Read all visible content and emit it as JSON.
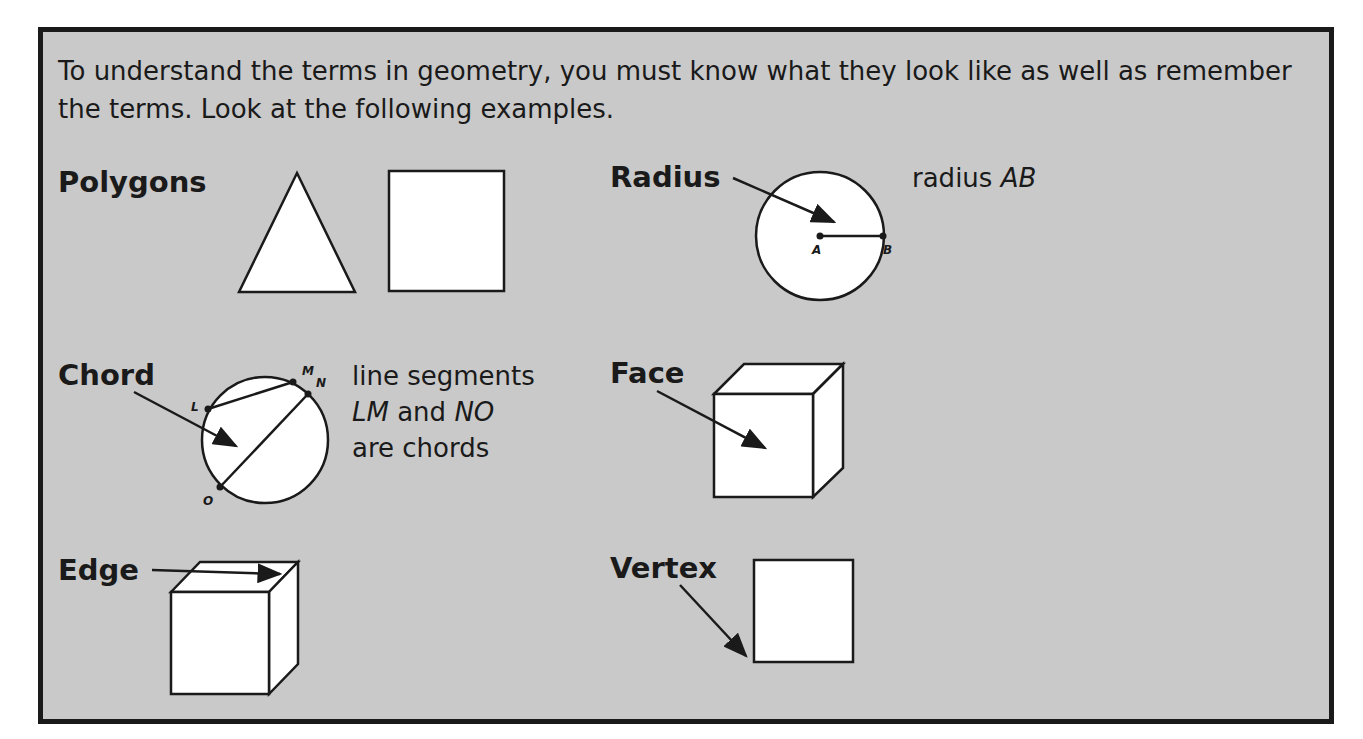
{
  "intro": "To understand the terms in geometry, you must know what they look like as well as remember the terms. Look at the following examples.",
  "terms": {
    "polygons": {
      "label": "Polygons"
    },
    "radius": {
      "label": "Radius",
      "desc_prefix": "radius ",
      "desc_italic": "AB",
      "points": [
        "A",
        "B"
      ]
    },
    "chord": {
      "label": "Chord",
      "desc_line1": "line segments",
      "desc_line2_i1": "LM",
      "desc_line2_mid": " and ",
      "desc_line2_i2": "NO",
      "desc_line3": "are chords",
      "points": [
        "L",
        "M",
        "N",
        "O"
      ]
    },
    "face": {
      "label": "Face"
    },
    "edge": {
      "label": "Edge"
    },
    "vertex": {
      "label": "Vertex"
    }
  },
  "colors": {
    "panel_bg": "#c9c9c9",
    "border": "#1a1a1a",
    "shape_fill": "#ffffff"
  }
}
